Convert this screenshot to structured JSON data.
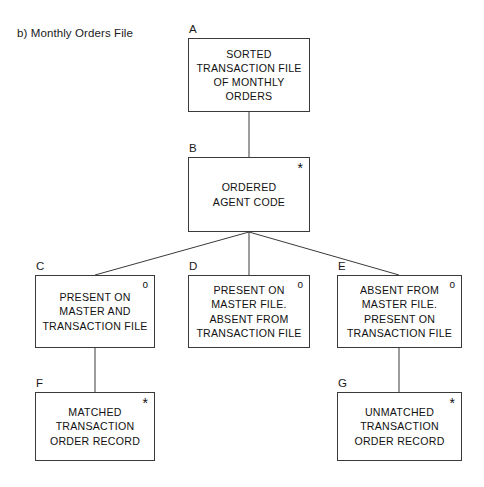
{
  "title": "b) Monthly Orders File",
  "markers": {
    "iteration": "*",
    "selection": "o"
  },
  "line_color": "#3a3a3a",
  "nodes": [
    {
      "tag": "A",
      "text": "SORTED\nTRANSACTION FILE\nOF MONTHLY\nORDERS",
      "marker": "",
      "x": 188,
      "y": 38,
      "w": 122,
      "h": 74
    },
    {
      "tag": "B",
      "text": "ORDERED\nAGENT CODE",
      "marker": "*",
      "x": 188,
      "y": 157,
      "w": 122,
      "h": 75
    },
    {
      "tag": "C",
      "text": "PRESENT ON\nMASTER AND\nTRANSACTION FILE",
      "marker": "o",
      "x": 35,
      "y": 275,
      "w": 120,
      "h": 73
    },
    {
      "tag": "D",
      "text": "PRESENT ON\nMASTER FILE.\nABSENT FROM\nTRANSACTION FILE",
      "marker": "o",
      "x": 188,
      "y": 275,
      "w": 122,
      "h": 73
    },
    {
      "tag": "E",
      "text": "ABSENT FROM\nMASTER FILE.\nPRESENT ON\nTRANSACTION FILE",
      "marker": "o",
      "x": 337,
      "y": 275,
      "w": 125,
      "h": 73
    },
    {
      "tag": "F",
      "text": "MATCHED\nTRANSACTION\nORDER RECORD",
      "marker": "*",
      "x": 35,
      "y": 392,
      "w": 120,
      "h": 69
    },
    {
      "tag": "G",
      "text": "UNMATCHED\nTRANSACTION\nORDER RECORD",
      "marker": "*",
      "x": 337,
      "y": 392,
      "w": 125,
      "h": 69
    }
  ],
  "connectors": [
    {
      "from": "A",
      "to": "B",
      "x1": 249,
      "y1": 112,
      "x2": 249,
      "y2": 157
    },
    {
      "from": "B",
      "to": "C",
      "x1": 249,
      "y1": 232,
      "x2": 95,
      "y2": 275
    },
    {
      "from": "B",
      "to": "D",
      "x1": 249,
      "y1": 232,
      "x2": 249,
      "y2": 275
    },
    {
      "from": "B",
      "to": "E",
      "x1": 249,
      "y1": 232,
      "x2": 399,
      "y2": 275
    },
    {
      "from": "C",
      "to": "F",
      "x1": 95,
      "y1": 348,
      "x2": 95,
      "y2": 392
    },
    {
      "from": "E",
      "to": "G",
      "x1": 399,
      "y1": 348,
      "x2": 399,
      "y2": 392
    }
  ]
}
